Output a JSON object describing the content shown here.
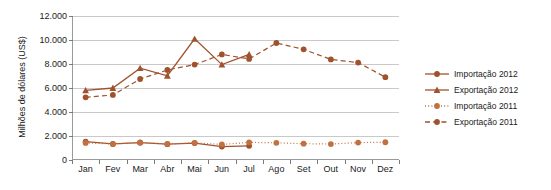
{
  "chart_data": {
    "type": "line",
    "title": "",
    "xlabel": "",
    "ylabel": "Milhões de dólares (US$)",
    "categories": [
      "Jan",
      "Fev",
      "Mar",
      "Abr",
      "Mai",
      "Jun",
      "Jul",
      "Ago",
      "Set",
      "Out",
      "Nov",
      "Dez"
    ],
    "ylim": [
      0,
      12000
    ],
    "ytick_values": [
      0,
      2000,
      4000,
      6000,
      8000,
      10000,
      12000
    ],
    "ytick_labels": [
      "0",
      "2.000",
      "4.000",
      "6.000",
      "8.000",
      "10.000",
      "12.000"
    ],
    "grid": "horizontal",
    "legend_position": "right",
    "series": [
      {
        "name": "Importação 2012",
        "line_style": "solid",
        "marker": "circle",
        "color": "#a0522d",
        "values": [
          1530,
          1340,
          1440,
          1320,
          1410,
          1120,
          1180,
          null,
          null,
          null,
          null,
          null
        ]
      },
      {
        "name": "Exportação 2012",
        "line_style": "solid",
        "marker": "triangle",
        "color": "#a0522d",
        "values": [
          5800,
          6000,
          7650,
          7020,
          10100,
          7950,
          8800,
          null,
          null,
          null,
          null,
          null
        ]
      },
      {
        "name": "Importação 2011",
        "line_style": "dotted",
        "marker": "circle",
        "color": "#c1713f",
        "values": [
          1420,
          1330,
          1460,
          1340,
          1430,
          1300,
          1470,
          1430,
          1360,
          1330,
          1450,
          1480
        ]
      },
      {
        "name": "Exportação 2011",
        "line_style": "dashed",
        "marker": "circle",
        "color": "#a0522d",
        "values": [
          5220,
          5420,
          6750,
          7500,
          7950,
          8800,
          8420,
          9750,
          9220,
          8380,
          8120,
          6900
        ]
      }
    ]
  },
  "legend": {
    "items": [
      {
        "label": "Importação 2012"
      },
      {
        "label": "Exportação 2012"
      },
      {
        "label": "Importação 2011"
      },
      {
        "label": "Exportação 2011"
      }
    ]
  },
  "colors": {
    "series_primary": "#a0522d",
    "series_light": "#c1713f",
    "gridline": "#c9c9c9",
    "axis": "#9a9a9a",
    "text": "#1a1a1a"
  }
}
